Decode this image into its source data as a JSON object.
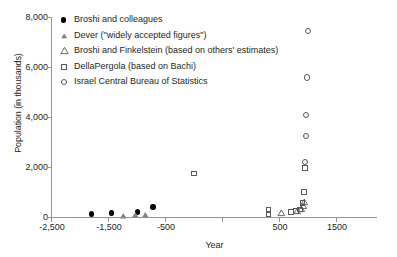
{
  "chart_data": {
    "type": "scatter",
    "title": "",
    "xlabel": "Year",
    "ylabel": "Population (in thousands)",
    "xlim": [
      -2500,
      2050
    ],
    "ylim": [
      0,
      8000
    ],
    "xticks": [
      "-2,500",
      "-1,500",
      "-500",
      "500",
      "1500"
    ],
    "xtick_values": [
      -2500,
      -1500,
      -500,
      500,
      1500
    ],
    "yticks": [
      "0",
      "2,000",
      "4,000",
      "6,000",
      "8,000"
    ],
    "ytick_values": [
      0,
      2000,
      4000,
      6000,
      8000
    ],
    "grid": false,
    "legend_position": "upper-left-inside",
    "series": [
      {
        "name": "Broshi and colleagues",
        "marker": "filled-circle",
        "color": "#000000",
        "points": [
          {
            "x": -1800,
            "y": 120
          },
          {
            "x": -1450,
            "y": 150
          },
          {
            "x": -1000,
            "y": 190
          },
          {
            "x": -720,
            "y": 400
          }
        ]
      },
      {
        "name": "Dever (\"widely accepted figures\")",
        "marker": "filled-triangle",
        "color": "#808285",
        "points": [
          {
            "x": -1240,
            "y": 40
          },
          {
            "x": -1030,
            "y": 75
          },
          {
            "x": -860,
            "y": 90
          }
        ]
      },
      {
        "name": "Broshi and Finkelstein (based on others' estimates)",
        "marker": "open-triangle",
        "color": "#58595b",
        "points": [
          {
            "x": 1530,
            "y": 180
          },
          {
            "x": 1800,
            "y": 250
          },
          {
            "x": 1880,
            "y": 330
          },
          {
            "x": 1910,
            "y": 450
          },
          {
            "x": 1930,
            "y": 600
          }
        ]
      },
      {
        "name": "DellaPergola (based on Bachi)",
        "marker": "open-square",
        "color": "#58595b",
        "points": [
          {
            "x": 0,
            "y": 1740
          },
          {
            "x": 1300,
            "y": 130
          },
          {
            "x": 1300,
            "y": 290
          },
          {
            "x": 1700,
            "y": 210
          },
          {
            "x": 1780,
            "y": 230
          },
          {
            "x": 1850,
            "y": 300
          },
          {
            "x": 1900,
            "y": 560
          },
          {
            "x": 1920,
            "y": 1010
          },
          {
            "x": 1940,
            "y": 1960
          }
        ]
      },
      {
        "name": "Israel Central Bureau of Statistics",
        "marker": "open-circle",
        "color": "#58595b",
        "points": [
          {
            "x": 1945,
            "y": 2200
          },
          {
            "x": 1955,
            "y": 3250
          },
          {
            "x": 1960,
            "y": 4090
          },
          {
            "x": 1975,
            "y": 5580
          },
          {
            "x": 1995,
            "y": 7440
          }
        ]
      }
    ],
    "legend_entries": [
      {
        "label": "Broshi and colleagues",
        "marker": "filled-circle"
      },
      {
        "label": "Dever (\"widely accepted figures\")",
        "marker": "filled-triangle"
      },
      {
        "label": "Broshi and Finkelstein (based on others' estimates)",
        "marker": "open-triangle"
      },
      {
        "label": "DellaPergola (based on Bachi)",
        "marker": "open-square"
      },
      {
        "label": "Israel Central Bureau of Statistics",
        "marker": "open-circle"
      }
    ]
  }
}
